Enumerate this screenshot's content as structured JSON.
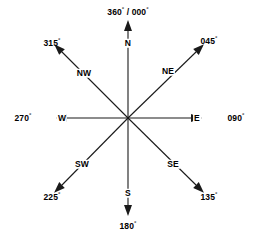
{
  "diagram": {
    "background_color": "#ffffff",
    "line_color": "#1a1a1a",
    "text_color": "#000000",
    "center": {
      "x": 128,
      "y": 118
    }
  },
  "rays": [
    {
      "id": "north",
      "direction_label": "N",
      "bearing_label": "360° / 000°",
      "bearing_degrees": 0,
      "dir_pos": {
        "x": 128,
        "y": 43
      },
      "deg_pos": {
        "x": 128,
        "y": 12
      },
      "line": {
        "x1": 128,
        "y1": 118,
        "x2": 128,
        "y2": 31
      },
      "arrow_angle": 270
    },
    {
      "id": "northeast",
      "direction_label": "NE",
      "bearing_label": "045°",
      "bearing_degrees": 45,
      "dir_pos": {
        "x": 168,
        "y": 71
      },
      "deg_pos": {
        "x": 209,
        "y": 41
      },
      "line": {
        "x1": 128,
        "y1": 118,
        "x2": 196,
        "y2": 52
      },
      "arrow_angle": 316
    },
    {
      "id": "east",
      "direction_label": "E",
      "bearing_label": "090°",
      "bearing_degrees": 90,
      "dir_pos": {
        "x": 197,
        "y": 118
      },
      "deg_pos": {
        "x": 236,
        "y": 118
      },
      "line": {
        "x1": 128,
        "y1": 118,
        "x2": 191,
        "y2": 118
      },
      "arrow_angle": 0
    },
    {
      "id": "southeast",
      "direction_label": "SE",
      "bearing_label": "135°",
      "bearing_degrees": 135,
      "dir_pos": {
        "x": 173,
        "y": 164
      },
      "deg_pos": {
        "x": 209,
        "y": 197
      },
      "line": {
        "x1": 128,
        "y1": 118,
        "x2": 196,
        "y2": 185
      },
      "arrow_angle": 44
    },
    {
      "id": "south",
      "direction_label": "S",
      "bearing_label": "180°",
      "bearing_degrees": 180,
      "dir_pos": {
        "x": 128,
        "y": 193
      },
      "deg_pos": {
        "x": 128,
        "y": 226
      },
      "line": {
        "x1": 128,
        "y1": 118,
        "x2": 128,
        "y2": 205
      },
      "arrow_angle": 90
    },
    {
      "id": "southwest",
      "direction_label": "SW",
      "bearing_label": "225°",
      "bearing_degrees": 225,
      "dir_pos": {
        "x": 82,
        "y": 164
      },
      "deg_pos": {
        "x": 52,
        "y": 197
      },
      "line": {
        "x1": 128,
        "y1": 118,
        "x2": 62,
        "y2": 185
      },
      "arrow_angle": 136
    },
    {
      "id": "west",
      "direction_label": "W",
      "bearing_label": "270°",
      "bearing_degrees": 270,
      "dir_pos": {
        "x": 62,
        "y": 118
      },
      "deg_pos": {
        "x": 23,
        "y": 118
      },
      "line": {
        "x1": 128,
        "y1": 118,
        "x2": 67,
        "y2": 118
      },
      "arrow_angle": 180
    },
    {
      "id": "northwest",
      "direction_label": "NW",
      "bearing_label": "315°",
      "bearing_degrees": 315,
      "dir_pos": {
        "x": 84,
        "y": 73
      },
      "deg_pos": {
        "x": 52,
        "y": 43
      },
      "line": {
        "x1": 128,
        "y1": 118,
        "x2": 62,
        "y2": 52
      },
      "arrow_angle": 225
    }
  ]
}
